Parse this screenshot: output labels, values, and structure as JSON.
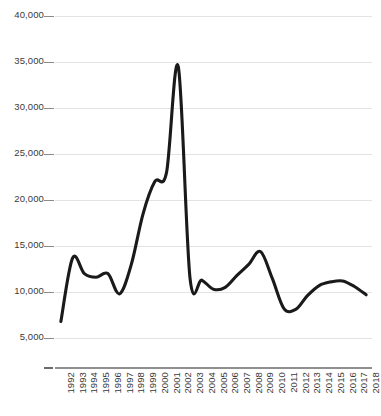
{
  "chart_data": {
    "type": "line",
    "title": "",
    "subtitle": "",
    "xlabel": "",
    "ylabel": "",
    "grid": true,
    "legend": false,
    "legend_position": "none",
    "line_color": "#1a1a1a",
    "grid_color": "#e3e3e3",
    "axis_color": "#8f8f8f",
    "text_color": "#3a3a3a",
    "smoothing": "spline",
    "ylim": [
      0,
      40000
    ],
    "yticks": [
      5000,
      10000,
      15000,
      20000,
      25000,
      30000,
      35000,
      40000
    ],
    "ytick_labels": [
      "5,000",
      "10,000",
      "15,000",
      "20,000",
      "25,000",
      "30,000",
      "35,000",
      "40,000"
    ],
    "categories": [
      "1992",
      "1993",
      "1994",
      "1995",
      "1996",
      "1997",
      "1998",
      "1999",
      "2000",
      "2001",
      "2002",
      "2003",
      "2004",
      "2005",
      "2006",
      "2007",
      "2008",
      "2009",
      "2010",
      "2011",
      "2012",
      "2013",
      "2014",
      "2015",
      "2016",
      "2017",
      "2018"
    ],
    "values": [
      6800,
      13700,
      12000,
      11600,
      12000,
      9800,
      13000,
      18500,
      22000,
      23000,
      34500,
      11500,
      11300,
      10300,
      10500,
      11800,
      13000,
      14400,
      11500,
      8200,
      8100,
      9600,
      10700,
      11100,
      11200,
      10600,
      9700
    ]
  }
}
